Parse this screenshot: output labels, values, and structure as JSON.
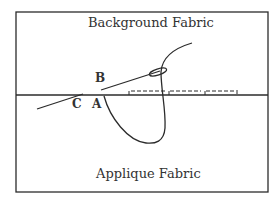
{
  "diagram": {
    "regions": {
      "top": "Background Fabric",
      "bottom": "Applique Fabric"
    },
    "points": {
      "a": "A",
      "b": "B",
      "c": "C"
    },
    "colors": {
      "line": "#2b2b2b",
      "text": "#333333",
      "background": "#ffffff"
    }
  }
}
